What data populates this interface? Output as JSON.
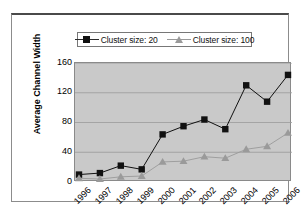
{
  "chart_data": {
    "type": "line",
    "title": "",
    "subtitle": "",
    "xlabel": "",
    "ylabel": "Average Channel Width",
    "categories": [
      "1996",
      "1997",
      "1998",
      "1999",
      "2000",
      "2001",
      "2002",
      "2003",
      "2004",
      "2005",
      "2006"
    ],
    "x": [
      1996,
      1997,
      1998,
      1999,
      2000,
      2001,
      2002,
      2003,
      2004,
      2005,
      2006
    ],
    "series": [
      {
        "name": "Cluster size: 20",
        "marker": "square",
        "color": "#111111",
        "values": [
          10,
          12,
          22,
          17,
          64,
          75,
          84,
          71,
          130,
          108,
          144
        ]
      },
      {
        "name": "Cluster size: 100",
        "marker": "triangle",
        "color": "#9a9a9a",
        "values": [
          5,
          4,
          7,
          8,
          27,
          28,
          34,
          32,
          44,
          48,
          66
        ]
      }
    ],
    "yticks": [
      0,
      40,
      80,
      120,
      160
    ],
    "ylim": [
      0,
      160
    ],
    "xlim": [
      "1996",
      "2006"
    ],
    "grid": "horizontal",
    "legend_position": "top-center",
    "plot_background": "#c9c9c9",
    "figure_background": "#ffffff"
  },
  "legend": {
    "entries": [
      {
        "label": "Cluster size: 20",
        "marker": "square-marker-icon"
      },
      {
        "label": "Cluster size: 100",
        "marker": "triangle-marker-icon"
      }
    ]
  },
  "axes": {
    "y_title": "Average Channel Width",
    "y_tick_labels": [
      "160",
      "120",
      "80",
      "40",
      "0"
    ],
    "x_tick_labels": [
      "1996",
      "1997",
      "1998",
      "1999",
      "2000",
      "2001",
      "2002",
      "2003",
      "2004",
      "2005",
      "2006"
    ]
  }
}
